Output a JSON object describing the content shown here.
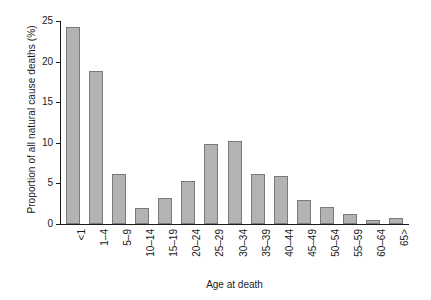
{
  "chart_data": {
    "type": "bar",
    "title": "",
    "xlabel": "Age at death",
    "ylabel": "Proportion of all natural cause deaths (%)",
    "categories": [
      "<1",
      "1–4",
      "5–9",
      "10–14",
      "15–19",
      "20–24",
      "25–29",
      "30–34",
      "35–39",
      "40–44",
      "45–49",
      "50–54",
      "55–59",
      "60–64",
      "65>"
    ],
    "values": [
      24.3,
      18.9,
      6.1,
      2.0,
      3.2,
      5.3,
      9.9,
      10.2,
      6.2,
      5.9,
      3.0,
      2.1,
      1.2,
      0.5,
      0.8
    ],
    "ylim": [
      0,
      25
    ],
    "yticks": [
      0,
      5,
      10,
      15,
      20,
      25
    ],
    "ytick_labels": [
      "0",
      "5",
      "10",
      "15",
      "20",
      "25"
    ],
    "grid": false,
    "legend": false,
    "bar_fill_color": "#b3b3b3",
    "bar_edge_color": "#7a7a7a",
    "axis_color": "#1a1a1a"
  }
}
